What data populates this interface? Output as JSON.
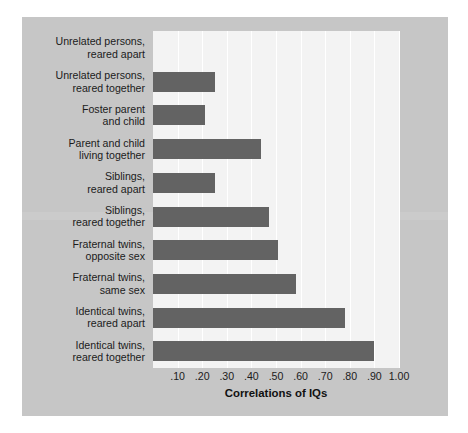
{
  "colors": {
    "panel_background": "#c6c6c6",
    "plot_background": "#f3f3f3",
    "bar": "#636363",
    "gridline": "#ffffff",
    "text": "#1b1b1b"
  },
  "chart_data": {
    "type": "bar",
    "orientation": "horizontal",
    "title": "",
    "xlabel": "Correlations of IQs",
    "ylabel": "",
    "xlim": [
      0,
      1.0
    ],
    "grid": true,
    "legend": null,
    "xticks": [
      0.1,
      0.2,
      0.3,
      0.4,
      0.5,
      0.6,
      0.7,
      0.8,
      0.9,
      1.0
    ],
    "xtick_labels": [
      ".10",
      ".20",
      ".30",
      ".40",
      ".50",
      ".60",
      ".70",
      ".80",
      ".90",
      "1.00"
    ],
    "categories": [
      "Unrelated persons, reared apart",
      "Unrelated persons, reared together",
      "Foster parent and child",
      "Parent and child living together",
      "Siblings, reared apart",
      "Siblings, reared together",
      "Fraternal twins, opposite sex",
      "Fraternal twins, same sex",
      "Identical twins, reared apart",
      "Identical twins, reared together"
    ],
    "category_lines": [
      [
        "Unrelated persons,",
        "reared apart"
      ],
      [
        "Unrelated persons,",
        "reared together"
      ],
      [
        "Foster parent",
        "and child"
      ],
      [
        "Parent and child",
        "living together"
      ],
      [
        "Siblings,",
        "reared apart"
      ],
      [
        "Siblings,",
        "reared together"
      ],
      [
        "Fraternal twins,",
        "opposite sex"
      ],
      [
        "Fraternal twins,",
        "same sex"
      ],
      [
        "Identical twins,",
        "reared apart"
      ],
      [
        "Identical twins,",
        "reared together"
      ]
    ],
    "values": [
      0.0,
      0.25,
      0.21,
      0.44,
      0.25,
      0.47,
      0.51,
      0.58,
      0.78,
      0.9
    ]
  }
}
